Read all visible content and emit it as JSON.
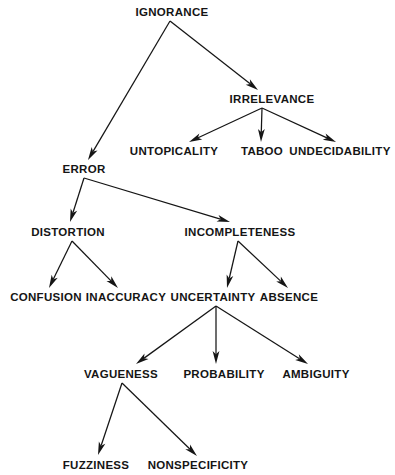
{
  "diagram": {
    "type": "tree",
    "background_color": "#ffffff",
    "text_color": "#151515",
    "edge_color": "#151515",
    "nodes": [
      {
        "id": "ignorance",
        "label": "IGNORANCE",
        "x": 172,
        "y": 13,
        "level": 0
      },
      {
        "id": "irrelevance",
        "label": "IRRELEVANCE",
        "x": 272,
        "y": 100,
        "level": 1
      },
      {
        "id": "error",
        "label": "ERROR",
        "x": 84,
        "y": 170,
        "level": 1
      },
      {
        "id": "untopicality",
        "label": "UNTOPICALITY",
        "x": 174,
        "y": 152,
        "level": 2
      },
      {
        "id": "taboo",
        "label": "TABOO",
        "x": 262,
        "y": 152,
        "level": 2
      },
      {
        "id": "undecidability",
        "label": "UNDECIDABILITY",
        "x": 340,
        "y": 152,
        "level": 2
      },
      {
        "id": "distortion",
        "label": "DISTORTION",
        "x": 68,
        "y": 233,
        "level": 2
      },
      {
        "id": "incompleteness",
        "label": "INCOMPLETENESS",
        "x": 240,
        "y": 233,
        "level": 2
      },
      {
        "id": "confusion",
        "label": "CONFUSION",
        "x": 46,
        "y": 298,
        "level": 3
      },
      {
        "id": "inaccuracy",
        "label": "INACCURACY",
        "x": 126,
        "y": 298,
        "level": 3
      },
      {
        "id": "uncertainty",
        "label": "UNCERTAINTY",
        "x": 213,
        "y": 298,
        "level": 3
      },
      {
        "id": "absence",
        "label": "ABSENCE",
        "x": 289,
        "y": 298,
        "level": 3
      },
      {
        "id": "vagueness",
        "label": "VAGUENESS",
        "x": 121,
        "y": 375,
        "level": 4
      },
      {
        "id": "probability",
        "label": "PROBABILITY",
        "x": 224,
        "y": 375,
        "level": 4
      },
      {
        "id": "ambiguity",
        "label": "AMBIGUITY",
        "x": 316,
        "y": 375,
        "level": 4
      },
      {
        "id": "fuzziness",
        "label": "FUZZINESS",
        "x": 96,
        "y": 466,
        "level": 5
      },
      {
        "id": "nonspecificity",
        "label": "NONSPECIFICITY",
        "x": 198,
        "y": 466,
        "level": 5
      }
    ],
    "edges": [
      {
        "from": "ignorance",
        "to": "error",
        "x1": 170,
        "y1": 21,
        "x2": 88,
        "y2": 160
      },
      {
        "from": "ignorance",
        "to": "irrelevance",
        "x1": 170,
        "y1": 21,
        "x2": 258,
        "y2": 90
      },
      {
        "from": "irrelevance",
        "to": "untopicality",
        "x1": 262,
        "y1": 108,
        "x2": 189,
        "y2": 142
      },
      {
        "from": "irrelevance",
        "to": "taboo",
        "x1": 262,
        "y1": 108,
        "x2": 261,
        "y2": 142
      },
      {
        "from": "irrelevance",
        "to": "undecidability",
        "x1": 262,
        "y1": 108,
        "x2": 336,
        "y2": 142
      },
      {
        "from": "error",
        "to": "distortion",
        "x1": 84,
        "y1": 178,
        "x2": 70,
        "y2": 222
      },
      {
        "from": "error",
        "to": "incompleteness",
        "x1": 84,
        "y1": 178,
        "x2": 230,
        "y2": 222
      },
      {
        "from": "distortion",
        "to": "confusion",
        "x1": 72,
        "y1": 241,
        "x2": 49,
        "y2": 288
      },
      {
        "from": "distortion",
        "to": "inaccuracy",
        "x1": 72,
        "y1": 241,
        "x2": 118,
        "y2": 288
      },
      {
        "from": "incompleteness",
        "to": "uncertainty",
        "x1": 238,
        "y1": 241,
        "x2": 227,
        "y2": 288
      },
      {
        "from": "incompleteness",
        "to": "absence",
        "x1": 238,
        "y1": 241,
        "x2": 288,
        "y2": 288
      },
      {
        "from": "uncertainty",
        "to": "vagueness",
        "x1": 216,
        "y1": 306,
        "x2": 136,
        "y2": 364
      },
      {
        "from": "uncertainty",
        "to": "probability",
        "x1": 216,
        "y1": 306,
        "x2": 216,
        "y2": 364
      },
      {
        "from": "uncertainty",
        "to": "ambiguity",
        "x1": 216,
        "y1": 306,
        "x2": 308,
        "y2": 364
      },
      {
        "from": "vagueness",
        "to": "fuzziness",
        "x1": 122,
        "y1": 383,
        "x2": 98,
        "y2": 455
      },
      {
        "from": "vagueness",
        "to": "nonspecificity",
        "x1": 122,
        "y1": 383,
        "x2": 197,
        "y2": 456
      }
    ]
  }
}
